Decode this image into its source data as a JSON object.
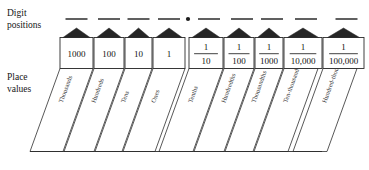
{
  "figure": {
    "labels": {
      "digit_positions_line1": "Digit",
      "digit_positions_line2": "positions",
      "place_values_line1": "Place",
      "place_values_line2": "values"
    },
    "decimal_point": "•",
    "digit_slot_count": 9,
    "decimal_point_after_slot": 4,
    "columns": [
      {
        "place_value": "1000",
        "numerator": "",
        "denominator": "",
        "is_fraction": false,
        "name": "Thousands"
      },
      {
        "place_value": "100",
        "numerator": "",
        "denominator": "",
        "is_fraction": false,
        "name": "Hundreds"
      },
      {
        "place_value": "10",
        "numerator": "",
        "denominator": "",
        "is_fraction": false,
        "name": "Tens"
      },
      {
        "place_value": "1",
        "numerator": "",
        "denominator": "",
        "is_fraction": false,
        "name": "Ones"
      },
      {
        "place_value": "1/10",
        "numerator": "1",
        "denominator": "10",
        "is_fraction": true,
        "name": "Tenths"
      },
      {
        "place_value": "1/100",
        "numerator": "1",
        "denominator": "100",
        "is_fraction": true,
        "name": "Hundredths"
      },
      {
        "place_value": "1/1000",
        "numerator": "1",
        "denominator": "1000",
        "is_fraction": true,
        "name": "Thousandths"
      },
      {
        "place_value": "1/10,000",
        "numerator": "1",
        "denominator": "10,000",
        "is_fraction": true,
        "name": "Ten-thousandths"
      },
      {
        "place_value": "1/100,000",
        "numerator": "1",
        "denominator": "100,000",
        "is_fraction": true,
        "name": "Hundred-thousandths"
      }
    ],
    "colors": {
      "roof_fill": "#262626",
      "outline": "#2a2a2a",
      "text": "#121212",
      "background": "#ffffff"
    }
  }
}
